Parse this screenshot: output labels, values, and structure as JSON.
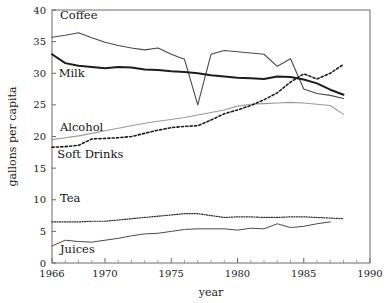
{
  "chart_data": {
    "type": "line",
    "title": "",
    "xlabel": "year",
    "ylabel": "gallons per capita",
    "xlim": [
      1966,
      1990
    ],
    "ylim": [
      0,
      40
    ],
    "xticks": [
      1966,
      1970,
      1975,
      1980,
      1985,
      1990
    ],
    "xtick_labels": [
      "1966",
      "1970",
      "1975",
      "1980",
      "1985",
      "1990"
    ],
    "yticks": [
      0,
      5,
      10,
      15,
      20,
      25,
      30,
      35,
      40
    ],
    "ytick_labels": [
      "0",
      "5",
      "10",
      "15",
      "20",
      "25",
      "30",
      "35",
      "40"
    ],
    "grid": false,
    "legend": "inline-labels",
    "minor_xticks_every": 1,
    "series": [
      {
        "name": "Coffee",
        "label": "Coffee",
        "color": "#4a4a4a",
        "width": 1.1,
        "dash": "none",
        "label_x": 1966.6,
        "label_y": 38.6,
        "x": [
          1966,
          1967,
          1968,
          1969,
          1970,
          1971,
          1972,
          1973,
          1974,
          1975,
          1976,
          1977,
          1978,
          1979,
          1980,
          1981,
          1982,
          1983,
          1984,
          1985,
          1986,
          1987,
          1988
        ],
        "values": [
          35.7,
          36.0,
          36.4,
          35.6,
          34.9,
          34.4,
          34.0,
          33.7,
          34.0,
          33.0,
          32.2,
          25.0,
          33.0,
          33.6,
          33.4,
          33.2,
          33.0,
          31.1,
          32.3,
          27.5,
          26.8,
          26.5,
          26.0
        ]
      },
      {
        "name": "Milk",
        "label": "Milk",
        "color": "#1d1d1d",
        "width": 2.0,
        "dash": "none",
        "label_x": 1966.5,
        "label_y": 29.4,
        "x": [
          1966,
          1967,
          1968,
          1969,
          1970,
          1971,
          1972,
          1973,
          1974,
          1975,
          1976,
          1977,
          1978,
          1979,
          1980,
          1981,
          1982,
          1983,
          1984,
          1985,
          1986,
          1987,
          1988
        ],
        "values": [
          33.0,
          31.6,
          31.2,
          31.0,
          30.8,
          31.0,
          30.9,
          30.6,
          30.5,
          30.3,
          30.2,
          30.0,
          29.7,
          29.5,
          29.3,
          29.2,
          29.1,
          29.5,
          29.4,
          29.0,
          28.4,
          27.4,
          26.6
        ]
      },
      {
        "name": "Alcohol",
        "label": "Alcohol",
        "color": "#9a9a9a",
        "width": 1.1,
        "dash": "none",
        "label_x": 1966.6,
        "label_y": 20.9,
        "x": [
          1966,
          1967,
          1968,
          1969,
          1970,
          1971,
          1972,
          1973,
          1974,
          1975,
          1976,
          1977,
          1978,
          1979,
          1980,
          1981,
          1982,
          1983,
          1984,
          1985,
          1986,
          1987,
          1988
        ],
        "values": [
          19.5,
          19.8,
          20.1,
          20.5,
          20.9,
          21.3,
          21.7,
          22.1,
          22.4,
          22.7,
          23.0,
          23.4,
          23.8,
          24.2,
          24.8,
          25.1,
          25.2,
          25.3,
          25.4,
          25.3,
          25.1,
          24.9,
          23.5
        ]
      },
      {
        "name": "Soft Drinks",
        "label": "Soft  Drinks",
        "color": "#1d1d1d",
        "width": 1.6,
        "dash": "2.2,2.2",
        "label_x": 1966.4,
        "label_y": 16.6,
        "x": [
          1966,
          1967,
          1968,
          1969,
          1970,
          1971,
          1972,
          1973,
          1974,
          1975,
          1976,
          1977,
          1978,
          1979,
          1980,
          1981,
          1982,
          1983,
          1984,
          1985,
          1986,
          1987,
          1988
        ],
        "values": [
          18.3,
          18.4,
          18.6,
          19.6,
          19.7,
          19.8,
          20.0,
          20.5,
          21.0,
          21.4,
          21.6,
          21.7,
          22.6,
          23.6,
          24.2,
          24.9,
          25.8,
          26.9,
          28.6,
          29.9,
          29.1,
          30.0,
          31.4
        ]
      },
      {
        "name": "Tea",
        "label": "Tea",
        "color": "#2b2b2b",
        "width": 1.2,
        "dash": "1.1,1.4",
        "label_x": 1966.6,
        "label_y": 9.6,
        "x": [
          1966,
          1967,
          1968,
          1969,
          1970,
          1971,
          1972,
          1973,
          1974,
          1975,
          1976,
          1977,
          1978,
          1979,
          1980,
          1981,
          1982,
          1983,
          1984,
          1985,
          1986,
          1987,
          1988
        ],
        "values": [
          6.5,
          6.5,
          6.5,
          6.6,
          6.6,
          6.8,
          7.0,
          7.2,
          7.4,
          7.6,
          7.8,
          7.8,
          7.5,
          7.2,
          7.3,
          7.3,
          7.2,
          7.2,
          7.3,
          7.3,
          7.2,
          7.1,
          7.0
        ]
      },
      {
        "name": "Juices",
        "label": "Juices",
        "color": "#4a4a4a",
        "width": 1.0,
        "dash": "none",
        "label_x": 1966.6,
        "label_y": 1.6,
        "x": [
          1966,
          1967,
          1968,
          1969,
          1970,
          1971,
          1972,
          1973,
          1974,
          1975,
          1976,
          1977,
          1978,
          1979,
          1980,
          1981,
          1982,
          1983,
          1984,
          1985,
          1986,
          1987
        ],
        "values": [
          2.7,
          3.6,
          3.4,
          3.3,
          3.6,
          3.9,
          4.3,
          4.6,
          4.7,
          5.0,
          5.3,
          5.4,
          5.4,
          5.4,
          5.2,
          5.5,
          5.4,
          6.2,
          5.6,
          5.8,
          6.2,
          6.5
        ]
      }
    ]
  }
}
